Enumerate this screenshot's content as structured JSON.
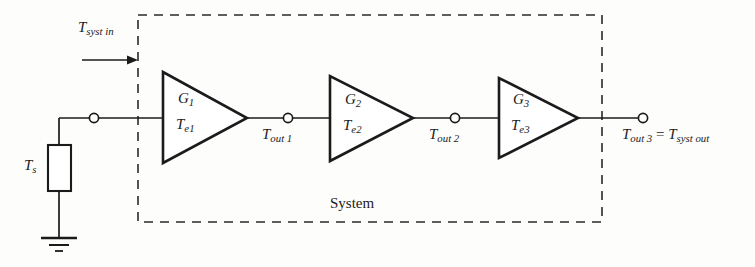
{
  "diagram": {
    "type": "circuit-block-diagram",
    "background_color": "#fdfdfc",
    "line_color": "#1b1b1b",
    "boundary": {
      "label": "System",
      "style": "dashed",
      "x": 138,
      "y": 15,
      "width": 464,
      "height": 207
    },
    "source": {
      "resistor_label": "T",
      "resistor_sub": "s",
      "ground": "ground-symbol"
    },
    "input": {
      "label_main": "T",
      "label_sub": "syst in",
      "arrow": "right-arrow"
    },
    "stages": [
      {
        "gain_main": "G",
        "gain_sub": "1",
        "temp_main": "T",
        "temp_sub": "e1",
        "output_main": "T",
        "output_sub": "out 1"
      },
      {
        "gain_main": "G",
        "gain_sub": "2",
        "temp_main": "T",
        "temp_sub": "e2",
        "output_main": "T",
        "output_sub": "out 2"
      },
      {
        "gain_main": "G",
        "gain_sub": "3",
        "temp_main": "T",
        "temp_sub": "e3",
        "output_main": "T",
        "output_sub": "out 3"
      }
    ],
    "output": {
      "main": "T",
      "sub": "out 3",
      "equals": "=",
      "main2": "T",
      "sub2": "syst out"
    },
    "nodes": [
      {
        "name": "source-node",
        "x": 94,
        "y": 118
      },
      {
        "name": "tout1-node",
        "x": 288,
        "y": 118
      },
      {
        "name": "tout2-node",
        "x": 455,
        "y": 118
      },
      {
        "name": "output-node",
        "x": 642,
        "y": 118
      }
    ]
  }
}
